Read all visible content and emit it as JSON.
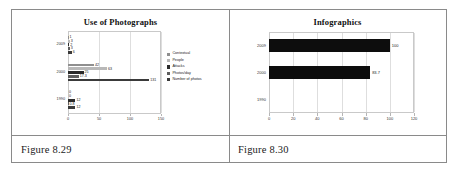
{
  "figures": [
    {
      "caption": "Figure 8.29"
    },
    {
      "caption": "Figure 8.30"
    }
  ],
  "chart_data": [
    {
      "type": "bar",
      "orientation": "horizontal",
      "title": "Use of Photographs",
      "xlabel": "",
      "ylabel": "",
      "categories": [
        "2009",
        "2000",
        "1990"
      ],
      "xlim": [
        0,
        150
      ],
      "xticks": [
        0,
        50,
        100,
        150
      ],
      "grid": true,
      "legend_position": "right",
      "series": [
        {
          "name": "Contextual",
          "values": [
            1,
            42,
            0
          ],
          "color": "#8f8f8f"
        },
        {
          "name": "People",
          "values": [
            3,
            63,
            0
          ],
          "color": "#b8b8b8"
        },
        {
          "name": "Attacks",
          "values": [
            2,
            25,
            12
          ],
          "color": "#2b2b2b"
        },
        {
          "name": "Photos/day",
          "values": [
            3,
            17.3,
            0.8
          ],
          "color": "#5e5e5e"
        },
        {
          "name": "Number of photos",
          "values": [
            6,
            131,
            12
          ],
          "color": "#3a3a3a"
        }
      ],
      "data_labels": {
        "2009": [
          "1",
          "3",
          "2",
          "3",
          "6"
        ],
        "2000": [
          "42",
          "63",
          "25",
          "17.3",
          "131"
        ],
        "1990": [
          "0",
          "0",
          "12",
          "0.8",
          "12"
        ]
      }
    },
    {
      "type": "bar",
      "orientation": "horizontal",
      "title": "Infographics",
      "xlabel": "",
      "ylabel": "",
      "categories": [
        "2009",
        "2000",
        "1990"
      ],
      "values": [
        100,
        83.7,
        0
      ],
      "data_labels": [
        "100",
        "83.7",
        ""
      ],
      "xlim": [
        0,
        120
      ],
      "xticks": [
        0,
        20,
        40,
        60,
        80,
        100,
        120
      ],
      "grid": true,
      "bar_color": "#0d0d0d"
    }
  ]
}
